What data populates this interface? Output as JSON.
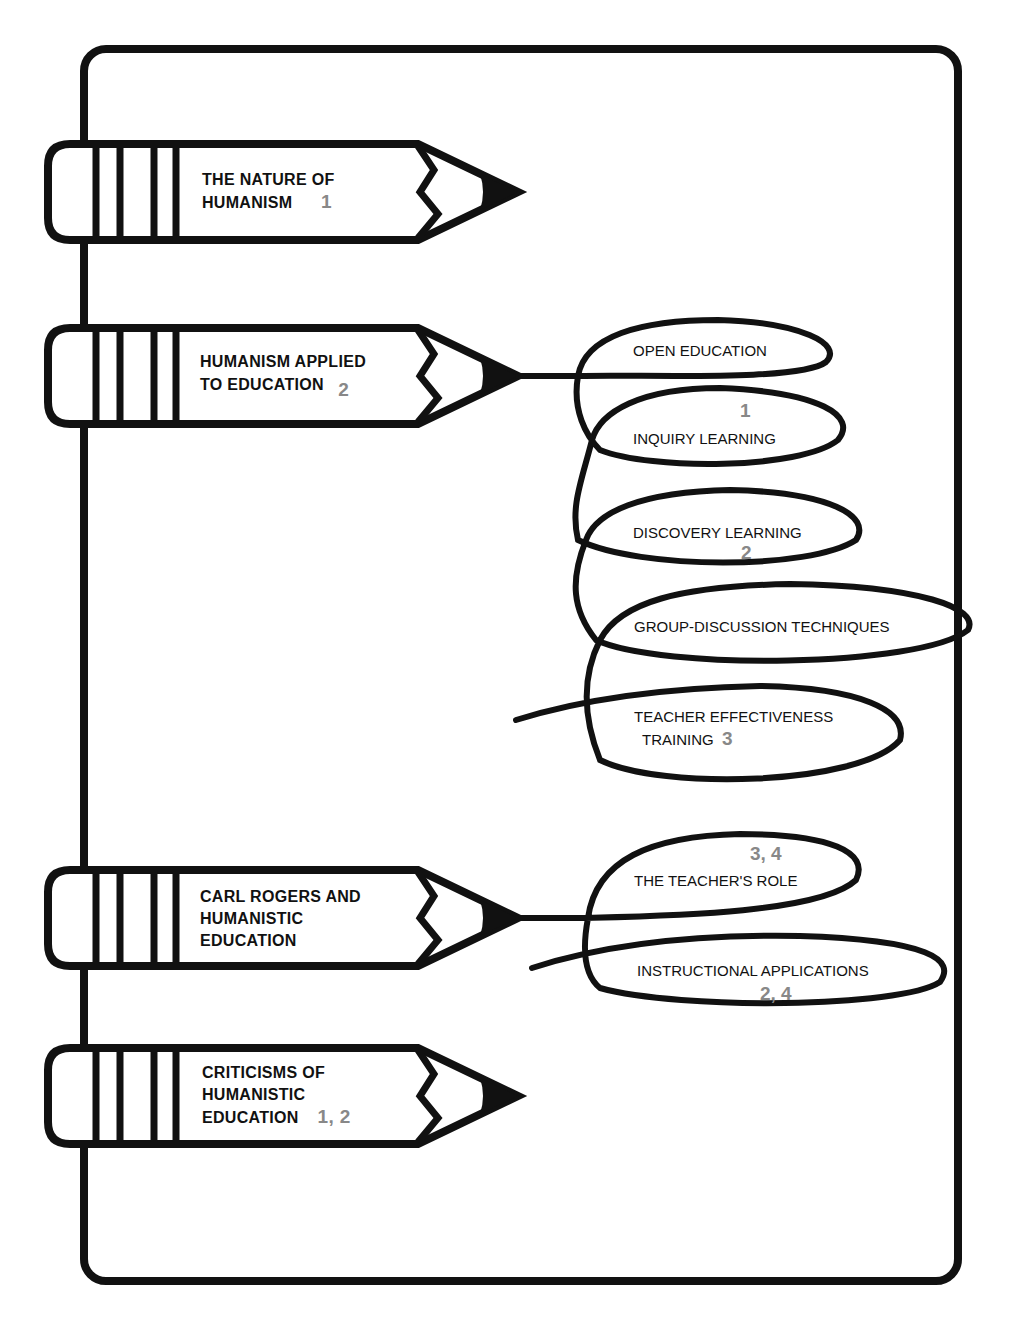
{
  "colors": {
    "ink": "#111111",
    "chapter_number": "#888888",
    "background": "#ffffff"
  },
  "topics": [
    {
      "label_line1": "THE NATURE OF",
      "label_line2": "HUMANISM",
      "label_line3": "",
      "chapters": "1"
    },
    {
      "label_line1": "HUMANISM APPLIED",
      "label_line2": "TO EDUCATION",
      "label_line3": "",
      "chapters": "2",
      "subtopics": [
        {
          "label": "OPEN EDUCATION",
          "chapters": ""
        },
        {
          "label": "INQUIRY LEARNING",
          "chapters": "1"
        },
        {
          "label": "DISCOVERY LEARNING",
          "chapters": "2"
        },
        {
          "label": "GROUP-DISCUSSION TECHNIQUES",
          "chapters": ""
        },
        {
          "label_line1": "TEACHER EFFECTIVENESS",
          "label_line2": "TRAINING",
          "chapters": "3"
        }
      ]
    },
    {
      "label_line1": "CARL ROGERS AND",
      "label_line2": "HUMANISTIC",
      "label_line3": "EDUCATION",
      "chapters": "",
      "subtopics": [
        {
          "label": "THE TEACHER'S ROLE",
          "chapters": "3, 4"
        },
        {
          "label": "INSTRUCTIONAL APPLICATIONS",
          "chapters": "2, 4"
        }
      ]
    },
    {
      "label_line1": "CRITICISMS OF",
      "label_line2": "HUMANISTIC",
      "label_line3": "EDUCATION",
      "chapters": "1, 2"
    }
  ]
}
